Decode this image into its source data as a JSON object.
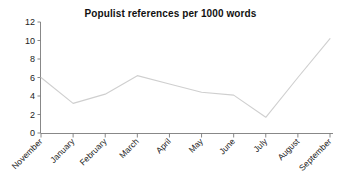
{
  "chart_data": {
    "type": "line",
    "title": "Populist references per 1000 words",
    "xlabel": "",
    "ylabel": "",
    "categories": [
      "November",
      "January",
      "February",
      "March",
      "April",
      "May",
      "June",
      "July",
      "August",
      "September"
    ],
    "values": [
      6.0,
      3.2,
      4.2,
      6.2,
      5.3,
      4.4,
      4.1,
      1.7,
      6.0,
      10.2
    ],
    "series": [
      {
        "name": "Populist references per 1000 words",
        "values": [
          6.0,
          3.2,
          4.2,
          6.2,
          5.3,
          4.4,
          4.1,
          1.7,
          6.0,
          10.2
        ]
      }
    ],
    "ylim": [
      0,
      12
    ],
    "ytick_labels": [
      "0",
      "2",
      "4",
      "6",
      "8",
      "10",
      "12"
    ],
    "ytick_values": [
      0,
      2,
      4,
      6,
      8,
      10,
      12
    ],
    "grid": false,
    "legend": false,
    "legend_position": "none",
    "line_color": "#cfcfcf",
    "axis_color": "#7a7a7a",
    "background_color": "#ffffff",
    "text_color": "#1a1a1a",
    "xtick_label_rotation": -45
  }
}
